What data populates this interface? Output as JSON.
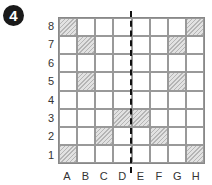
{
  "figure_number": "4",
  "grid": {
    "rows": [
      "8",
      "7",
      "6",
      "5",
      "4",
      "3",
      "2",
      "1"
    ],
    "columns": [
      "A",
      "B",
      "C",
      "D",
      "E",
      "F",
      "G",
      "H"
    ],
    "shaded_cells": [
      "A8",
      "H8",
      "B7",
      "G7",
      "B5",
      "G5",
      "D3",
      "E3",
      "C2",
      "F2",
      "A1",
      "H1"
    ],
    "symmetry_line": "between D and E (dashed)"
  }
}
